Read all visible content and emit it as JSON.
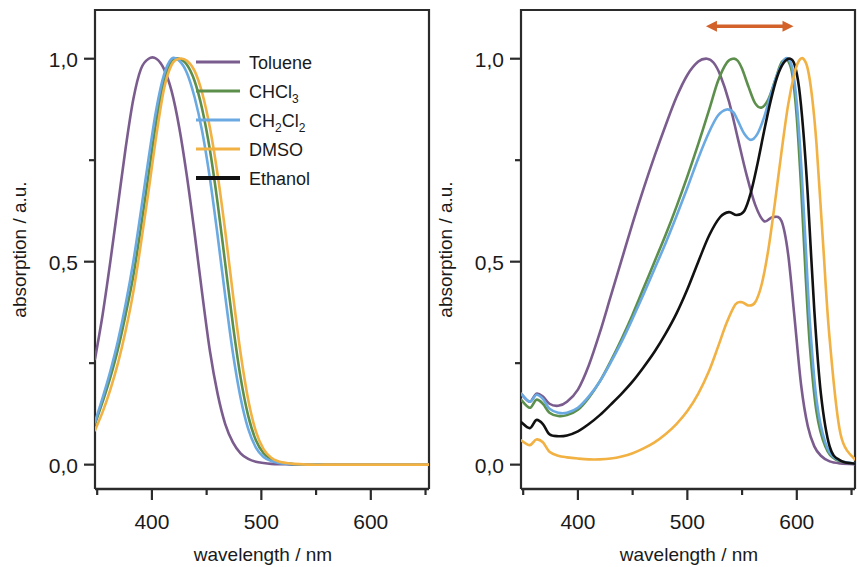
{
  "figure": {
    "background": "#ffffff",
    "axis_color": "#2b2b2b"
  },
  "series_colors": {
    "Toluene": "#7b5c8e",
    "CHCl3": "#5c8f4c",
    "CH2Cl2": "#6aa9e2",
    "DMSO": "#f2b143",
    "Ethanol": "#111111"
  },
  "legend": {
    "position": "top-right-of-left-panel",
    "items": [
      {
        "label": "Toluene",
        "sub": "",
        "label2": "",
        "sub2": "",
        "color_key": "Toluene"
      },
      {
        "label": "CHCl",
        "sub": "3",
        "label2": "",
        "sub2": "",
        "color_key": "CHCl3"
      },
      {
        "label": "CH",
        "sub": "2",
        "label2": "Cl",
        "sub2": "2",
        "color_key": "CH2Cl2"
      },
      {
        "label": "DMSO",
        "sub": "",
        "label2": "",
        "sub2": "",
        "color_key": "DMSO"
      },
      {
        "label": "Ethanol",
        "sub": "",
        "label2": "",
        "sub2": "",
        "color_key": "Ethanol"
      }
    ]
  },
  "annotation": {
    "type": "double-headed-arrow",
    "color": "#d2622a",
    "panel": "right",
    "x_start_nm": 517,
    "x_end_nm": 597,
    "y_value": 1.08
  },
  "chart_data": [
    {
      "type": "line",
      "panel": "left",
      "title": "",
      "xlabel": "wavelength / nm",
      "ylabel": "absorption / a.u.",
      "xlim": [
        348,
        655
      ],
      "ylim": [
        -0.06,
        1.12
      ],
      "xticks": [
        400,
        500,
        600
      ],
      "xticklabels": [
        "400",
        "500",
        "600"
      ],
      "xminorticks": [
        350,
        450,
        550,
        650
      ],
      "yticks": [
        0.0,
        0.5,
        1.0
      ],
      "yticklabels": [
        "0,0",
        "0,5",
        "1,0"
      ],
      "yminorticks": [
        0.25,
        0.75
      ],
      "grid": false,
      "legend": true,
      "series": [
        {
          "name": "Toluene",
          "color_key": "Toluene",
          "x": [
            348,
            355,
            362,
            369,
            376,
            383,
            390,
            397,
            404,
            411,
            418,
            425,
            432,
            439,
            446,
            453,
            460,
            467,
            474,
            481,
            488,
            495,
            502,
            509,
            516,
            523,
            530,
            545,
            565,
            590,
            620,
            655
          ],
          "y": [
            0.26,
            0.37,
            0.5,
            0.64,
            0.78,
            0.9,
            0.975,
            1.0,
            1.0,
            0.975,
            0.92,
            0.83,
            0.71,
            0.57,
            0.42,
            0.28,
            0.175,
            0.1,
            0.055,
            0.028,
            0.014,
            0.007,
            0.004,
            0.002,
            0.001,
            0.001,
            0.0,
            0.0,
            0.0,
            0.0,
            0.0,
            0.0
          ]
        },
        {
          "name": "CHCl3",
          "color_key": "CHCl3",
          "x": [
            348,
            355,
            362,
            369,
            376,
            383,
            390,
            397,
            404,
            411,
            418,
            425,
            432,
            439,
            446,
            453,
            460,
            467,
            474,
            481,
            488,
            495,
            502,
            509,
            516,
            523,
            530,
            545,
            565,
            590,
            620,
            655
          ],
          "y": [
            0.1,
            0.155,
            0.215,
            0.285,
            0.37,
            0.465,
            0.585,
            0.715,
            0.845,
            0.945,
            0.995,
            1.0,
            0.985,
            0.945,
            0.875,
            0.775,
            0.645,
            0.495,
            0.345,
            0.215,
            0.12,
            0.06,
            0.028,
            0.013,
            0.006,
            0.003,
            0.001,
            0.0,
            0.0,
            0.0,
            0.0,
            0.0
          ]
        },
        {
          "name": "CH2Cl2",
          "color_key": "CH2Cl2",
          "x": [
            348,
            355,
            362,
            369,
            376,
            383,
            390,
            397,
            404,
            411,
            418,
            425,
            432,
            439,
            446,
            453,
            460,
            467,
            474,
            481,
            488,
            495,
            502,
            509,
            516,
            523,
            530,
            545,
            565,
            590,
            620,
            655
          ],
          "y": [
            0.105,
            0.165,
            0.23,
            0.305,
            0.395,
            0.5,
            0.625,
            0.755,
            0.875,
            0.96,
            1.0,
            0.995,
            0.965,
            0.905,
            0.82,
            0.705,
            0.565,
            0.415,
            0.275,
            0.165,
            0.088,
            0.042,
            0.019,
            0.009,
            0.004,
            0.002,
            0.001,
            0.0,
            0.0,
            0.0,
            0.0,
            0.0
          ]
        },
        {
          "name": "DMSO",
          "color_key": "DMSO",
          "x": [
            348,
            355,
            362,
            369,
            376,
            383,
            390,
            397,
            404,
            411,
            418,
            425,
            432,
            439,
            446,
            453,
            460,
            467,
            474,
            481,
            488,
            495,
            502,
            509,
            516,
            523,
            530,
            545,
            565,
            590,
            620,
            655
          ],
          "y": [
            0.085,
            0.13,
            0.185,
            0.25,
            0.33,
            0.425,
            0.545,
            0.675,
            0.81,
            0.925,
            0.985,
            1.0,
            0.995,
            0.97,
            0.915,
            0.83,
            0.715,
            0.575,
            0.42,
            0.275,
            0.16,
            0.082,
            0.038,
            0.017,
            0.008,
            0.004,
            0.002,
            0.0,
            0.0,
            0.0,
            0.0,
            0.0
          ]
        }
      ]
    },
    {
      "type": "line",
      "panel": "right",
      "title": "",
      "xlabel": "wavelength / nm",
      "ylabel": "absorption / a.u.",
      "xlim": [
        348,
        655
      ],
      "ylim": [
        -0.06,
        1.12
      ],
      "xticks": [
        400,
        500,
        600
      ],
      "xticklabels": [
        "400",
        "500",
        "600"
      ],
      "xminorticks": [
        350,
        450,
        550,
        650
      ],
      "yticks": [
        0.0,
        0.5,
        1.0
      ],
      "yticklabels": [
        "0,0",
        "0,5",
        "1,0"
      ],
      "yminorticks": [
        0.25,
        0.75
      ],
      "grid": false,
      "legend": false,
      "series": [
        {
          "name": "Toluene",
          "color_key": "Toluene",
          "x": [
            348,
            356,
            362,
            368,
            374,
            382,
            390,
            400,
            410,
            420,
            430,
            440,
            450,
            460,
            470,
            480,
            490,
            500,
            510,
            518,
            524,
            530,
            538,
            546,
            554,
            562,
            570,
            578,
            586,
            592,
            598,
            604,
            610,
            616,
            622,
            630,
            640,
            655
          ],
          "y": [
            0.175,
            0.155,
            0.175,
            0.168,
            0.15,
            0.145,
            0.155,
            0.185,
            0.245,
            0.325,
            0.415,
            0.505,
            0.595,
            0.68,
            0.76,
            0.835,
            0.905,
            0.96,
            0.993,
            1.0,
            0.99,
            0.96,
            0.895,
            0.805,
            0.715,
            0.64,
            0.6,
            0.61,
            0.6,
            0.52,
            0.36,
            0.195,
            0.095,
            0.045,
            0.022,
            0.008,
            0.003,
            0.001
          ]
        },
        {
          "name": "CHCl3",
          "color_key": "CHCl3",
          "x": [
            348,
            356,
            362,
            368,
            374,
            382,
            390,
            400,
            410,
            420,
            430,
            440,
            450,
            460,
            470,
            480,
            490,
            500,
            510,
            520,
            528,
            536,
            542,
            546,
            550,
            556,
            562,
            568,
            574,
            580,
            585,
            589,
            592,
            596,
            600,
            604,
            608,
            612,
            618,
            626,
            636,
            655
          ],
          "y": [
            0.16,
            0.14,
            0.16,
            0.15,
            0.128,
            0.12,
            0.122,
            0.135,
            0.165,
            0.205,
            0.255,
            0.31,
            0.37,
            0.435,
            0.5,
            0.565,
            0.635,
            0.71,
            0.79,
            0.875,
            0.945,
            0.99,
            1.0,
            0.995,
            0.975,
            0.93,
            0.89,
            0.88,
            0.9,
            0.945,
            0.985,
            0.998,
            0.995,
            0.96,
            0.855,
            0.68,
            0.47,
            0.29,
            0.13,
            0.045,
            0.012,
            0.002
          ]
        },
        {
          "name": "CH2Cl2",
          "color_key": "CH2Cl2",
          "x": [
            348,
            356,
            362,
            368,
            374,
            382,
            390,
            400,
            410,
            420,
            430,
            440,
            450,
            460,
            470,
            480,
            490,
            500,
            510,
            520,
            528,
            536,
            542,
            546,
            552,
            558,
            564,
            570,
            576,
            582,
            588,
            592,
            596,
            600,
            604,
            608,
            612,
            618,
            626,
            636,
            655
          ],
          "y": [
            0.175,
            0.155,
            0.172,
            0.162,
            0.138,
            0.128,
            0.128,
            0.14,
            0.168,
            0.205,
            0.252,
            0.303,
            0.36,
            0.42,
            0.482,
            0.545,
            0.612,
            0.682,
            0.755,
            0.82,
            0.86,
            0.875,
            0.868,
            0.848,
            0.815,
            0.8,
            0.815,
            0.855,
            0.91,
            0.96,
            0.995,
            1.0,
            0.975,
            0.89,
            0.74,
            0.545,
            0.35,
            0.16,
            0.055,
            0.014,
            0.002
          ]
        },
        {
          "name": "Ethanol",
          "color_key": "Ethanol",
          "x": [
            348,
            356,
            362,
            368,
            374,
            382,
            390,
            400,
            410,
            420,
            430,
            440,
            450,
            460,
            470,
            480,
            490,
            500,
            510,
            520,
            530,
            538,
            545,
            552,
            558,
            564,
            570,
            576,
            582,
            588,
            594,
            598,
            602,
            606,
            610,
            616,
            622,
            630,
            640,
            655
          ],
          "y": [
            0.105,
            0.09,
            0.11,
            0.1,
            0.075,
            0.07,
            0.072,
            0.082,
            0.1,
            0.122,
            0.148,
            0.175,
            0.205,
            0.24,
            0.278,
            0.322,
            0.372,
            0.432,
            0.5,
            0.565,
            0.61,
            0.622,
            0.615,
            0.625,
            0.67,
            0.74,
            0.82,
            0.895,
            0.955,
            0.99,
            1.0,
            0.985,
            0.93,
            0.82,
            0.665,
            0.38,
            0.175,
            0.045,
            0.01,
            0.002
          ]
        },
        {
          "name": "DMSO",
          "color_key": "DMSO",
          "x": [
            348,
            356,
            362,
            368,
            374,
            382,
            390,
            400,
            410,
            420,
            430,
            440,
            450,
            460,
            470,
            480,
            490,
            500,
            510,
            520,
            528,
            536,
            544,
            550,
            556,
            562,
            568,
            574,
            580,
            586,
            592,
            598,
            602,
            606,
            610,
            614,
            618,
            624,
            630,
            640,
            655
          ],
          "y": [
            0.06,
            0.048,
            0.062,
            0.055,
            0.032,
            0.022,
            0.018,
            0.015,
            0.013,
            0.013,
            0.015,
            0.02,
            0.028,
            0.04,
            0.055,
            0.075,
            0.1,
            0.132,
            0.175,
            0.232,
            0.29,
            0.35,
            0.395,
            0.4,
            0.392,
            0.4,
            0.445,
            0.53,
            0.645,
            0.77,
            0.885,
            0.965,
            0.995,
            1.0,
            0.975,
            0.905,
            0.79,
            0.545,
            0.31,
            0.075,
            0.008
          ]
        }
      ]
    }
  ]
}
